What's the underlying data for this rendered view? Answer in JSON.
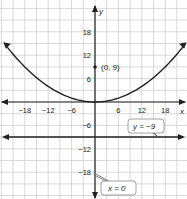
{
  "chart_data": {
    "type": "line",
    "title": "",
    "xlabel": "x",
    "ylabel": "y",
    "xlim": [
      -24,
      24
    ],
    "ylim": [
      -24,
      24
    ],
    "grid": true,
    "grid_step": 3,
    "x_ticks": [
      -18,
      -12,
      -6,
      6,
      12,
      18
    ],
    "y_ticks": [
      18,
      12,
      6,
      -6,
      -12,
      -18
    ],
    "x_tick_labels": [
      "−18",
      "−12",
      "−6",
      "6",
      "12",
      "18"
    ],
    "y_tick_labels": [
      "18",
      "12",
      "6",
      "−6",
      "−12",
      "−18"
    ],
    "series": [
      {
        "name": "parabola",
        "equation": "y = x^2/36",
        "x": [
          -24,
          -18,
          -12,
          -6,
          0,
          6,
          12,
          18,
          24
        ],
        "y": [
          16,
          9,
          4,
          1,
          0,
          1,
          4,
          9,
          16
        ]
      },
      {
        "name": "directrix",
        "equation": "y = -9",
        "x": [
          -24,
          24
        ],
        "y": [
          -9,
          -9
        ]
      },
      {
        "name": "axis of symmetry",
        "equation": "x = 0",
        "x": [
          0,
          0
        ],
        "y": [
          -24,
          24
        ]
      }
    ],
    "annotations": [
      {
        "text": "(0, 9)",
        "x": 0,
        "y": 9,
        "type": "point"
      },
      {
        "text": "y = −9",
        "type": "callout"
      },
      {
        "text": "x = 0",
        "type": "callout"
      }
    ]
  },
  "labels": {
    "x_axis": "x",
    "y_axis": "y",
    "focus": "(0, 9)",
    "directrix_label": "y = −9",
    "axis_label": "x = 0"
  }
}
